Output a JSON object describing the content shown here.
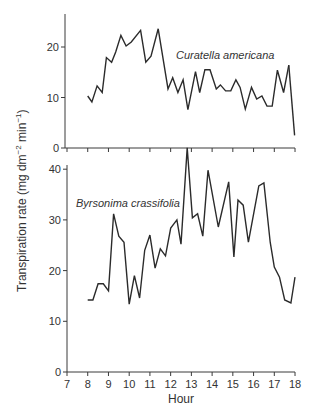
{
  "chart_data": {
    "type": "line",
    "title": "",
    "xlabel": "Hour",
    "ylabel": "Transpiration rate (mg dm⁻² min⁻¹)",
    "ylabel_parts": {
      "main": "Transpiration rate (mg dm",
      "sup1": "−2",
      "mid": " min",
      "sup2": "−1",
      "end": ")"
    },
    "xlim": [
      7,
      18
    ],
    "xticks": [
      7,
      8,
      9,
      10,
      11,
      12,
      13,
      14,
      15,
      16,
      17,
      18
    ],
    "grid": false,
    "legend": "inline annotations",
    "panels": [
      {
        "name": "Curatella americana",
        "ylim": [
          0,
          26
        ],
        "yticks": [
          0,
          10,
          20
        ],
        "series": [
          {
            "name": "Curatella americana",
            "x": [
              8.0,
              8.2,
              8.45,
              8.7,
              8.9,
              9.15,
              9.35,
              9.6,
              9.85,
              10.1,
              10.55,
              10.8,
              11.05,
              11.4,
              11.87,
              12.1,
              12.35,
              12.6,
              12.83,
              13.2,
              13.4,
              13.65,
              13.9,
              14.2,
              14.4,
              14.65,
              14.9,
              15.15,
              15.35,
              15.6,
              15.9,
              16.15,
              16.4,
              16.65,
              16.9,
              17.15,
              17.45,
              17.7
            ],
            "values": [
              10.3,
              9.1,
              12.3,
              11.0,
              17.9,
              17.0,
              19.0,
              22.3,
              20.2,
              21.0,
              23.3,
              17.0,
              18.2,
              23.6,
              11.7,
              13.9,
              11.0,
              13.5,
              7.6,
              15.1,
              11.0,
              15.5,
              15.5,
              11.7,
              12.5,
              11.3,
              11.3,
              13.5,
              12.0,
              7.7,
              12.0,
              9.7,
              10.3,
              8.3,
              8.3,
              15.4,
              11.0,
              16.4
            ]
          },
          {
            "name": "Curatella americana (end)",
            "x": [
              17.7,
              17.98
            ],
            "values": [
              16.4,
              2.5
            ]
          }
        ]
      },
      {
        "name": "Byrsonima crassifolia",
        "ylim": [
          0,
          40
        ],
        "yticks": [
          0,
          10,
          20,
          30,
          40
        ],
        "series": [
          {
            "name": "Byrsonima crassifolia",
            "x": [
              8.0,
              8.25,
              8.5,
              8.75,
              9.0,
              9.25,
              9.5,
              9.75,
              10.0,
              10.25,
              10.5,
              10.75,
              11.0,
              11.25,
              11.5,
              11.75,
              12.0,
              12.3,
              12.5,
              12.8,
              13.05,
              13.3,
              13.55,
              13.8,
              14.3,
              14.8,
              15.05,
              15.25,
              15.5,
              15.75,
              16.25,
              16.5,
              16.8,
              17.0,
              17.25,
              17.5,
              17.8,
              18.0
            ],
            "values": [
              14.2,
              14.2,
              17.4,
              17.4,
              16.0,
              31.2,
              26.8,
              25.6,
              13.4,
              19.0,
              14.6,
              24.0,
              27.0,
              20.5,
              24.3,
              22.9,
              28.4,
              30.0,
              25.2,
              44.2,
              30.4,
              31.2,
              26.8,
              39.8,
              28.6,
              37.5,
              22.7,
              33.9,
              32.9,
              25.6,
              36.7,
              37.3,
              25.6,
              20.7,
              18.7,
              14.2,
              13.6,
              18.7
            ]
          }
        ]
      }
    ]
  },
  "labels": {
    "top_species": "Curatella americana",
    "bottom_species": "Byrsonima crassifolia",
    "xlabel": "Hour"
  }
}
